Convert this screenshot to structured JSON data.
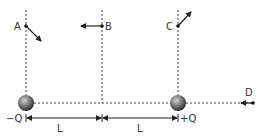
{
  "diagram": {
    "points": [
      {
        "id": "A",
        "label": "A",
        "x": 26,
        "y": 26,
        "arrow_to": [
          42,
          42
        ]
      },
      {
        "id": "B",
        "label": "B",
        "x": 102,
        "y": 26,
        "arrow_to": [
          80,
          26
        ]
      },
      {
        "id": "C",
        "label": "C",
        "x": 178,
        "y": 26,
        "arrow_to": [
          192,
          11
        ]
      },
      {
        "id": "D",
        "label": "D",
        "x": 253,
        "y": 103,
        "arrow_to": [
          240,
          103
        ]
      }
    ],
    "charges": [
      {
        "id": "neg",
        "label": "−Q",
        "x": 26,
        "y": 103
      },
      {
        "id": "pos",
        "label": "+Q",
        "x": 178,
        "y": 103
      }
    ],
    "dimensions": [
      {
        "label": "L",
        "from": 26,
        "to": 102
      },
      {
        "label": "L",
        "from": 102,
        "to": 178
      }
    ],
    "colors": {
      "line": "#222222",
      "dash": "#444444",
      "sphere_light": "#bbbbbb",
      "sphere_dark": "#333333"
    }
  }
}
